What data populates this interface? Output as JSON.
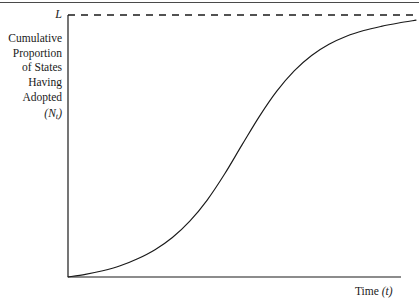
{
  "figure": {
    "top_rule": true,
    "background_color": "#ffffff",
    "line_color": "#1a1a1a"
  },
  "labels": {
    "asymptote": "L",
    "y_axis_lines": [
      "Cumulative",
      "Proportion",
      "of States",
      "Having",
      "Adopted"
    ],
    "y_axis_symbol_open": "(",
    "y_axis_symbol_base": "N",
    "y_axis_symbol_sub": "t",
    "y_axis_symbol_close": ")",
    "x_axis_text": "Time",
    "x_axis_symbol": "(t)"
  },
  "chart_data": {
    "type": "line",
    "title": "",
    "xlabel": "Time (t)",
    "ylabel": "Cumulative Proportion of States Having Adopted (Nt)",
    "grid": false,
    "legend": false,
    "xlim": [
      0,
      1
    ],
    "ylim": [
      0,
      1
    ],
    "annotations": [
      {
        "text": "L",
        "type": "asymptote-label",
        "y": 1.0,
        "description": "Upper asymptote of the cumulative adoption curve"
      }
    ],
    "reference_lines": [
      {
        "name": "upper-asymptote",
        "orientation": "horizontal",
        "y": 1.0,
        "style": "dashed"
      }
    ],
    "series": [
      {
        "name": "Cumulative adoption (logistic S-curve)",
        "style": "solid",
        "x": [
          0.0,
          0.05,
          0.1,
          0.15,
          0.2,
          0.25,
          0.3,
          0.35,
          0.4,
          0.45,
          0.5,
          0.55,
          0.6,
          0.65,
          0.7,
          0.75,
          0.8,
          0.85,
          0.9,
          0.95,
          1.0
        ],
        "y": [
          0.0,
          0.01,
          0.024,
          0.043,
          0.07,
          0.105,
          0.152,
          0.215,
          0.296,
          0.396,
          0.508,
          0.618,
          0.715,
          0.793,
          0.852,
          0.895,
          0.926,
          0.948,
          0.964,
          0.977,
          0.988
        ]
      }
    ]
  }
}
